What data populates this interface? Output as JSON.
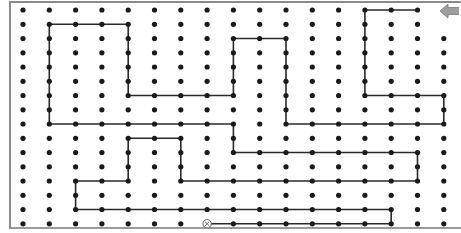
{
  "puzzle": {
    "type": "dot-grid-path",
    "grid": {
      "cols": 17,
      "rows": 16,
      "origin_x": 23,
      "origin_y": 10,
      "spacing_x": 26.3,
      "spacing_y": 14.25
    },
    "colors": {
      "dot": "#1a1a1a",
      "line": "#2a2a2a",
      "frame": "#8a8a8a",
      "arrow": "#9e9e9e",
      "arrow_edge": "#7a7a7a",
      "end_marker": "#555555"
    },
    "path": [
      [
        15,
        0
      ],
      [
        13,
        0
      ],
      [
        13,
        6
      ],
      [
        16,
        6
      ],
      [
        16,
        8
      ],
      [
        10,
        8
      ],
      [
        10,
        2
      ],
      [
        8,
        2
      ],
      [
        8,
        6
      ],
      [
        4,
        6
      ],
      [
        4,
        1
      ],
      [
        1,
        1
      ],
      [
        1,
        8
      ],
      [
        8,
        8
      ],
      [
        8,
        10
      ],
      [
        15,
        10
      ],
      [
        15,
        12
      ],
      [
        6,
        12
      ],
      [
        6,
        9
      ],
      [
        4,
        9
      ],
      [
        4,
        12
      ],
      [
        2,
        12
      ],
      [
        2,
        14
      ],
      [
        14,
        14
      ],
      [
        14,
        15
      ],
      [
        7,
        15
      ]
    ],
    "start_arrow": {
      "icon": "arrow-left-icon",
      "col": 16,
      "row": 0
    },
    "end_marker": {
      "icon": "circled-x-icon",
      "glyph": "⊗",
      "col": 7,
      "row": 15
    },
    "skip_dots": [
      [
        16,
        0
      ],
      [
        16,
        1
      ],
      [
        7,
        15
      ]
    ]
  }
}
